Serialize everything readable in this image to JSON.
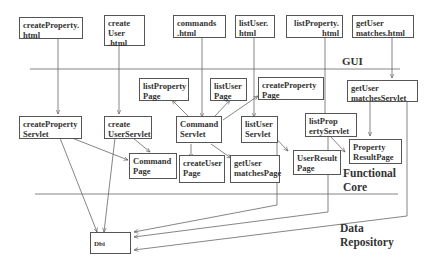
{
  "diagram": {
    "layers": {
      "gui": "GUI",
      "functional_core": "Functional\nCore",
      "data_repository": "Data\nRepository"
    },
    "html_pages": [
      {
        "id": "createProperty_html",
        "label": "createProperty.\nhtml"
      },
      {
        "id": "createUser_html",
        "label": "create\nUser\n.html"
      },
      {
        "id": "commands_html",
        "label": "commands\n.html"
      },
      {
        "id": "listUser_html",
        "label": "listUser.\nhtml"
      },
      {
        "id": "listProperty_html",
        "label": "listProperty.\n        html"
      },
      {
        "id": "getUsermatches_html",
        "label": "getUser\nmatches.html"
      }
    ],
    "servlets": [
      {
        "id": "createPropertyServlet",
        "label": "createProperty\nServlet"
      },
      {
        "id": "createUserServlet",
        "label": "create\nUserServlet"
      },
      {
        "id": "CommandServlet",
        "label": "Command\nServlet"
      },
      {
        "id": "listUserServlet",
        "label": "listUser\nServlet"
      },
      {
        "id": "listPropertyServlet",
        "label": "listProp\nertyServlet"
      },
      {
        "id": "getUsermatchesServlet",
        "label": "getUser\nmatchesServlet"
      }
    ],
    "pages": [
      {
        "id": "listPropertyPage",
        "label": "listProperty\nPage"
      },
      {
        "id": "listUserPage",
        "label": "listUser\nPage"
      },
      {
        "id": "createPropertyPage",
        "label": "createProperty\nPage"
      },
      {
        "id": "CommandPage",
        "label": "Command\nPage"
      },
      {
        "id": "createUserPage",
        "label": "createUser\nPage"
      },
      {
        "id": "getUsermatchesPage",
        "label": "getUser\nmatchesPage"
      },
      {
        "id": "UserResultPage",
        "label": "UserResult\nPage"
      },
      {
        "id": "PropertyResultPage",
        "label": "Property\nResultPage"
      }
    ],
    "repository": {
      "id": "Dbi",
      "label": "Dbi"
    },
    "edges": [
      [
        "createProperty_html",
        "createPropertyServlet"
      ],
      [
        "createUser_html",
        "createUserServlet"
      ],
      [
        "commands_html",
        "CommandServlet"
      ],
      [
        "listUser_html",
        "listUserServlet"
      ],
      [
        "listProperty_html",
        "listPropertyServlet"
      ],
      [
        "getUsermatches_html",
        "getUsermatchesServlet"
      ],
      [
        "CommandServlet",
        "listPropertyPage"
      ],
      [
        "CommandServlet",
        "listUserPage"
      ],
      [
        "CommandServlet",
        "createPropertyPage"
      ],
      [
        "CommandServlet",
        "createUserPage"
      ],
      [
        "CommandServlet",
        "getUsermatchesPage"
      ],
      [
        "createPropertyServlet",
        "CommandPage"
      ],
      [
        "createUserServlet",
        "CommandPage"
      ],
      [
        "listUserServlet",
        "UserResultPage"
      ],
      [
        "listPropertyServlet",
        "PropertyResultPage"
      ],
      [
        "getUsermatchesServlet",
        "PropertyResultPage"
      ],
      [
        "createPropertyServlet",
        "Dbi"
      ],
      [
        "createUserServlet",
        "Dbi"
      ],
      [
        "listUserServlet",
        "Dbi"
      ],
      [
        "listPropertyServlet",
        "Dbi"
      ],
      [
        "getUsermatchesServlet",
        "Dbi"
      ]
    ]
  }
}
